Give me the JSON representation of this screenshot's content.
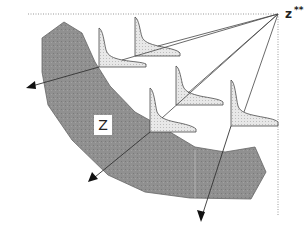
{
  "diagram": {
    "labels": {
      "feasible_region": "Z",
      "ideal_point": "z",
      "ideal_point_superscript": "**"
    },
    "colors": {
      "region_fill": "#8f8f8f",
      "region_stroke": "#5a5a5a",
      "front_fill": "#e4e4e4",
      "front_stroke": "#4a4a4a",
      "line": "#444444",
      "dotted": "#999999"
    }
  }
}
